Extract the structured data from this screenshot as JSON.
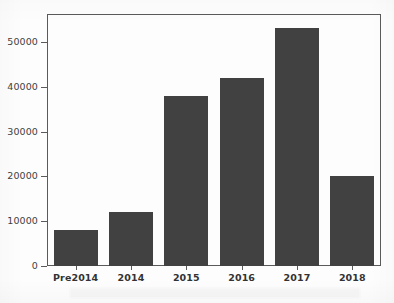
{
  "chart_data": {
    "type": "bar",
    "title": "",
    "xlabel": "",
    "ylabel": "",
    "categories": [
      "Pre2014",
      "2014",
      "2015",
      "2016",
      "2017",
      "2018"
    ],
    "values": [
      8000,
      12000,
      38000,
      42000,
      53000,
      20000
    ],
    "ylim": [
      0,
      56000
    ],
    "yticks": [
      0,
      10000,
      20000,
      30000,
      40000,
      50000
    ],
    "ytick_labels": [
      "0",
      "10000",
      "20000",
      "30000",
      "40000",
      "50000"
    ],
    "grid": false,
    "legend": null,
    "bar_color": "#414141",
    "axis_color": "#5a5a5a",
    "background_color": "#ffffff",
    "bar_width_fraction": 0.8
  },
  "figure": {
    "canvas_label": "bar-chart-canvas"
  }
}
